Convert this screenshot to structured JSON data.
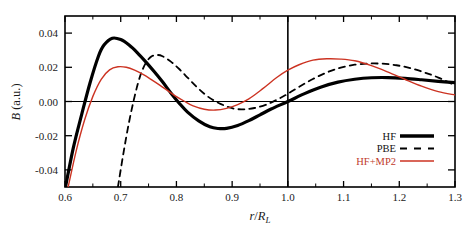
{
  "figure": {
    "background": "#ffffff",
    "frame_color": "#000000"
  },
  "chart_data": {
    "type": "line",
    "title": "",
    "xlabel": "r/R_L",
    "ylabel": "B (a.u.)",
    "xlim": [
      0.6,
      1.3
    ],
    "ylim": [
      -0.05,
      0.05
    ],
    "xticks": [
      0.6,
      0.7,
      0.8,
      0.9,
      1.0,
      1.1,
      1.2,
      1.3
    ],
    "xticklabels": [
      "0.6",
      "0.7",
      "0.8",
      "0.9",
      "1.0",
      "1.1",
      "1.2",
      "1.3"
    ],
    "yticks": [
      0.04,
      0.02,
      0.0,
      -0.02,
      -0.04
    ],
    "yticklabels": [
      "0.04",
      "0.02",
      "0.00",
      "-0.02",
      "-0.04"
    ],
    "grid": false,
    "legend_position": "lower right",
    "reference_lines": [
      {
        "name": "zero-horizontal",
        "axis": "y",
        "value": 0.0,
        "color": "#000000"
      },
      {
        "name": "unity-vertical",
        "axis": "x",
        "value": 1.0,
        "color": "#000000"
      }
    ],
    "series": [
      {
        "name": "HF",
        "color": "#000000",
        "style": "solid",
        "width": 3.2,
        "x": [
          0.6,
          0.615,
          0.63,
          0.645,
          0.66,
          0.67,
          0.685,
          0.7,
          0.715,
          0.73,
          0.745,
          0.76,
          0.775,
          0.79,
          0.805,
          0.82,
          0.84,
          0.86,
          0.875,
          0.89,
          0.91,
          0.93,
          0.95,
          0.97,
          1.0,
          1.03,
          1.06,
          1.09,
          1.12,
          1.15,
          1.18,
          1.21,
          1.24,
          1.27,
          1.3
        ],
        "y": [
          -0.0515,
          -0.027,
          -0.0075,
          0.011,
          0.0265,
          0.033,
          0.037,
          0.0362,
          0.033,
          0.0285,
          0.0232,
          0.0175,
          0.0115,
          0.005,
          -0.001,
          -0.0062,
          -0.0113,
          -0.0148,
          -0.0158,
          -0.0157,
          -0.014,
          -0.0112,
          -0.0078,
          -0.0044,
          0.0,
          0.0046,
          0.0085,
          0.0113,
          0.013,
          0.0139,
          0.014,
          0.0135,
          0.0127,
          0.0118,
          0.011
        ]
      },
      {
        "name": "PBE",
        "color": "#000000",
        "style": "dashed",
        "width": 1.8,
        "x": [
          0.695,
          0.705,
          0.715,
          0.725,
          0.735,
          0.745,
          0.755,
          0.765,
          0.775,
          0.79,
          0.805,
          0.82,
          0.835,
          0.85,
          0.865,
          0.88,
          0.895,
          0.91,
          0.925,
          0.94,
          0.96,
          0.98,
          1.0,
          1.02,
          1.045,
          1.07,
          1.095,
          1.12,
          1.145,
          1.17,
          1.195,
          1.22,
          1.245,
          1.27,
          1.3
        ],
        "y": [
          -0.05,
          -0.03,
          -0.012,
          0.003,
          0.015,
          0.0225,
          0.0263,
          0.0272,
          0.0265,
          0.0233,
          0.019,
          0.014,
          0.009,
          0.0045,
          0.001,
          -0.0015,
          -0.0035,
          -0.0045,
          -0.0045,
          -0.0038,
          -0.002,
          0.001,
          0.0045,
          0.0085,
          0.0132,
          0.017,
          0.0198,
          0.0215,
          0.0222,
          0.0221,
          0.0212,
          0.0195,
          0.017,
          0.014,
          0.0095
        ]
      },
      {
        "name": "HF+MP2",
        "color": "#cc3322",
        "style": "solid",
        "width": 1.4,
        "x": [
          0.605,
          0.62,
          0.635,
          0.65,
          0.665,
          0.68,
          0.695,
          0.71,
          0.725,
          0.74,
          0.755,
          0.77,
          0.785,
          0.8,
          0.815,
          0.83,
          0.85,
          0.87,
          0.89,
          0.91,
          0.93,
          0.955,
          0.98,
          1.0,
          1.02,
          1.045,
          1.07,
          1.095,
          1.12,
          1.15,
          1.18,
          1.21,
          1.24,
          1.27,
          1.3
        ],
        "y": [
          -0.051,
          -0.029,
          -0.011,
          0.003,
          0.013,
          0.0185,
          0.0203,
          0.02,
          0.0183,
          0.0158,
          0.0128,
          0.0096,
          0.0062,
          0.0028,
          0.0,
          -0.0025,
          -0.0045,
          -0.005,
          -0.004,
          -0.0018,
          0.0015,
          0.0075,
          0.014,
          0.0183,
          0.0215,
          0.0242,
          0.025,
          0.0248,
          0.0238,
          0.021,
          0.0172,
          0.013,
          0.009,
          0.0058,
          0.0038
        ]
      }
    ]
  },
  "legend": {
    "entries": [
      {
        "label": "HF",
        "style": "solid-thick",
        "color": "#000000"
      },
      {
        "label": "PBE",
        "style": "dashed",
        "color": "#000000"
      },
      {
        "label": "HF+MP2",
        "style": "solid-thin",
        "color": "#cc3322"
      }
    ]
  },
  "axis_label_parts": {
    "x_numerator": "r",
    "x_slash": "/",
    "x_denominator": "R",
    "x_subscript": "L",
    "y_symbol": "B",
    "y_units": "(a.u.)"
  }
}
